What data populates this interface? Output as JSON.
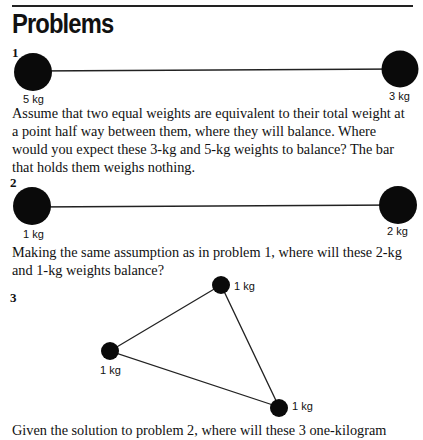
{
  "page": {
    "heading": "Problems"
  },
  "problems": [
    {
      "number": "1",
      "weights": [
        {
          "label": "5 kg",
          "position": "left"
        },
        {
          "label": "3 kg",
          "position": "right"
        }
      ],
      "text": "Assume that two equal weights are equivalent to their total weight at a point half way between them, where they will balance. Where would you expect these 3-kg and 5-kg weights to balance? The bar that holds them weighs nothing."
    },
    {
      "number": "2",
      "weights": [
        {
          "label": "1 kg",
          "position": "left"
        },
        {
          "label": "2 kg",
          "position": "right"
        }
      ],
      "text": "Making the same assumption as in problem 1, where will these 2-kg and 1-kg weights balance?"
    },
    {
      "number": "3",
      "weights": [
        {
          "label": "1 kg",
          "position": "top"
        },
        {
          "label": "1 kg",
          "position": "left"
        },
        {
          "label": "1 kg",
          "position": "bottom-right"
        }
      ],
      "text": "Given the solution to problem 2, where will these 3 one-kilogram"
    }
  ]
}
